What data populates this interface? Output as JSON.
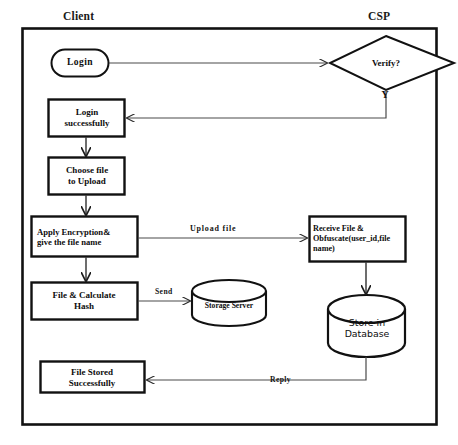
{
  "diagram": {
    "lanes": {
      "client": "Client",
      "csp": "CSP"
    },
    "nodes": {
      "login": {
        "label": "Login",
        "shape": "stadium"
      },
      "login_successfully": {
        "label": "Login\nsuccessfully",
        "shape": "rectangle"
      },
      "choose_file": {
        "label": "Choose file\nto Upload",
        "shape": "rectangle"
      },
      "apply_encryption": {
        "label": "Apply Encryption&\ngive the file name",
        "shape": "rectangle"
      },
      "calculate_hash": {
        "label": "File & Calculate\nHash",
        "shape": "rectangle"
      },
      "file_stored": {
        "label": "File Stored\nSuccessfully",
        "shape": "rectangle"
      },
      "verify": {
        "label": "Verify?",
        "shape": "diamond"
      },
      "receive_file": {
        "label": "Receive File &\nObfuscate(user_id,file\nname)",
        "shape": "rectangle"
      },
      "storage_server": {
        "label": "Storage Server",
        "shape": "cylinder"
      },
      "store_in_database": {
        "label": "Store in\nDatabase",
        "shape": "cylinder"
      }
    },
    "edge_labels": {
      "yes": "Y",
      "upload_file": "Upload  file",
      "send": "Send",
      "reply": "Reply"
    },
    "colors": {
      "stroke": "#111111",
      "thin_stroke": "#3a3a3a",
      "background": "#ffffff",
      "text": "#0d0d0d"
    }
  }
}
